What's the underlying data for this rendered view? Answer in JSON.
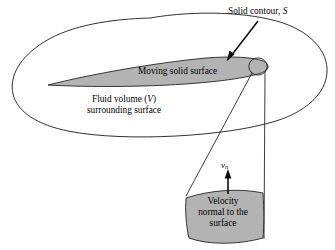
{
  "figure": {
    "background_color": "#ffffff",
    "line_color": "#1a1a1a",
    "fill_gray": "#b3b3b3",
    "labels": {
      "solid_contour": "Solid contour,",
      "solid_contour_symbol": "S",
      "moving_solid_surface": "Moving solid surface",
      "fluid_volume_line1_pre": "Fluid volume (",
      "fluid_volume_symbol": "V",
      "fluid_volume_line1_post": ")",
      "fluid_volume_line2": "surrounding surface",
      "velocity_line1": "Velocity",
      "velocity_line2": "normal to the",
      "velocity_line3": "surface",
      "velocity_symbol": "v",
      "velocity_subscript": "n"
    },
    "elements": {
      "fluid_volume_blob": "fluid-volume-outline",
      "airfoil": "moving-solid-surface-shape",
      "trailing_circle": "solid-contour-circle",
      "cone": "normal-velocity-cone",
      "velocity_patch": "velocity-patch",
      "pointer_arrow": "solid-contour-pointer",
      "normal_arrow": "normal-velocity-arrow"
    }
  }
}
